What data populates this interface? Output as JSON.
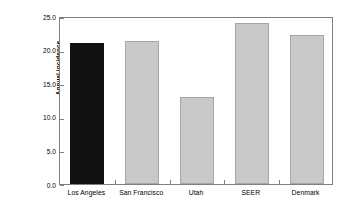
{
  "chart_data": {
    "type": "bar",
    "title": "",
    "subtitle": "",
    "xlabel": "",
    "ylabel": "Annual incidence (per 100,000)",
    "ylabel_lines": [
      "Annual incidence",
      "(per 100,000)"
    ],
    "categories": [
      "Los Angeles",
      "San Francisco",
      "Utah",
      "SEER",
      "Denmark"
    ],
    "values": [
      21.0,
      21.3,
      13.0,
      23.9,
      22.2
    ],
    "bar_colors": [
      "#111111",
      "#c9c9c9",
      "#c9c9c9",
      "#c9c9c9",
      "#c9c9c9"
    ],
    "bar_border_color": "#a6a6a6",
    "highlighted_category": "Los Angeles",
    "ylim": [
      0.0,
      25.0
    ],
    "ytick_values": [
      0.0,
      5.0,
      10.0,
      15.0,
      20.0,
      25.0
    ],
    "ytick_labels": [
      "0.0",
      "5.0",
      "10.0",
      "15.0",
      "20.0",
      "25.0"
    ],
    "grid": false,
    "legend": false,
    "legend_position": "none",
    "axis_color": "#808080",
    "background_color": "#ffffff"
  }
}
